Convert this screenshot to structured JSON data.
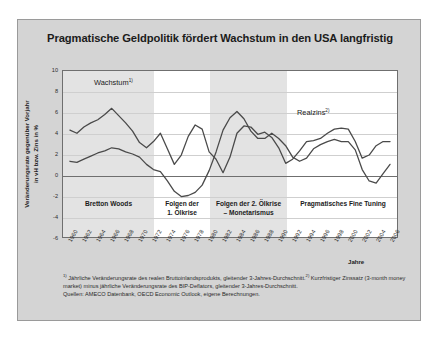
{
  "figure": {
    "title": "Pragmatische Geldpolitik fördert Wachstum in den USA langfristig",
    "background_color": "#d4d4d4",
    "plot_background_color": "#ffffff",
    "band_color": "#e3e3e3",
    "line_color": "#4a4a4a"
  },
  "axes": {
    "ylabel_line1": "Veränderungsrate gegenüber Vorjahr",
    "ylabel_line2": "in vH bzw. Zins in %",
    "xlabel": "Jahre"
  },
  "series_labels": {
    "wachstum": "Wachstum",
    "wachstum_sup": "1)",
    "realzins": "Realzins",
    "realzins_sup": "2)"
  },
  "regions": [
    {
      "name": "bretton-woods",
      "line1": "Bretton Woods",
      "line2": ""
    },
    {
      "name": "folgen-1-oelkrise",
      "line1": "Folgen der",
      "line2": "1. Ölkrise"
    },
    {
      "name": "folgen-2-oelkrise",
      "line1": "Folgen der 2. Ölkrise",
      "line2": "– Monetarismus"
    },
    {
      "name": "pragmatisches-fine-tuning",
      "line1": "Pragmatisches Fine Tuning",
      "line2": ""
    }
  ],
  "footnotes": {
    "line1_sup": "1)",
    "line1": " Jährliche Veränderungsrate des realen Bruttoinlandsprodukts, gleitender 3-Jahres-Durchschnitt.",
    "line2_sup": "2)",
    "line2": " Kurzfristiger Zinssatz (3-month money market) minus jährliche Veränderungsrate des BIP-Deflators, gleitender 3-Jahres-Durchschnitt.",
    "line3": "Quellen:  AMECO Datenbank, OECD Economic Outlook, eigene Berechnungen."
  },
  "chart_data": {
    "type": "line",
    "title": "Pragmatische Geldpolitik fördert Wachstum in den USA langfristig",
    "xlabel": "Jahre",
    "ylabel": "Veränderungsrate gegenüber Vorjahr in vH bzw. Zins in %",
    "xlim": [
      1959,
      2007
    ],
    "ylim": [
      -6,
      10
    ],
    "yticks": [
      10,
      8,
      6,
      4,
      2,
      0,
      -2,
      -4,
      -6
    ],
    "xticks": [
      1960,
      1962,
      1964,
      1966,
      1968,
      1970,
      1972,
      1974,
      1976,
      1978,
      1980,
      1982,
      1984,
      1986,
      1988,
      1990,
      1992,
      1994,
      1996,
      1998,
      2000,
      2002,
      2004,
      2006
    ],
    "grid": true,
    "legend": "inline-annotations",
    "shaded_bands": [
      {
        "label": "Bretton Woods",
        "x_start": 1959,
        "x_end": 1972
      },
      {
        "label": "Folgen der 2. Ölkrise – Monetarismus",
        "x_start": 1980,
        "x_end": 1991
      }
    ],
    "x": [
      1960,
      1961,
      1962,
      1963,
      1964,
      1965,
      1966,
      1967,
      1968,
      1969,
      1970,
      1971,
      1972,
      1973,
      1974,
      1975,
      1976,
      1977,
      1978,
      1979,
      1980,
      1981,
      1982,
      1983,
      1984,
      1985,
      1986,
      1987,
      1988,
      1989,
      1990,
      1991,
      1992,
      1993,
      1994,
      1995,
      1996,
      1997,
      1998,
      1999,
      2000,
      2001,
      2002,
      2003,
      2004,
      2005,
      2006
    ],
    "series": [
      {
        "name": "Wachstum",
        "footnote": "1)",
        "values": [
          4.3,
          4.0,
          4.6,
          5.0,
          5.3,
          5.8,
          6.4,
          5.7,
          5.0,
          4.2,
          3.1,
          2.6,
          3.2,
          4.0,
          2.5,
          1.0,
          1.9,
          3.7,
          4.8,
          4.4,
          2.2,
          1.5,
          0.2,
          1.7,
          4.0,
          4.7,
          4.6,
          3.9,
          4.1,
          3.6,
          2.6,
          1.1,
          1.5,
          2.3,
          3.2,
          3.3,
          3.5,
          4.0,
          4.4,
          4.5,
          4.4,
          3.2,
          1.6,
          1.9,
          2.8,
          3.2,
          3.2
        ]
      },
      {
        "name": "Realzins",
        "footnote": "2)",
        "values": [
          1.3,
          1.2,
          1.5,
          1.8,
          2.1,
          2.3,
          2.6,
          2.5,
          2.2,
          2.0,
          1.7,
          1.0,
          0.5,
          0.3,
          -0.6,
          -1.6,
          -2.1,
          -2.0,
          -1.7,
          -1.0,
          0.4,
          2.2,
          4.3,
          5.5,
          6.1,
          5.4,
          4.2,
          3.5,
          3.5,
          4.0,
          3.5,
          2.8,
          1.7,
          1.3,
          1.6,
          2.5,
          2.9,
          3.2,
          3.4,
          3.2,
          3.2,
          2.4,
          0.5,
          -0.6,
          -0.8,
          0.1,
          1.0
        ]
      }
    ]
  }
}
